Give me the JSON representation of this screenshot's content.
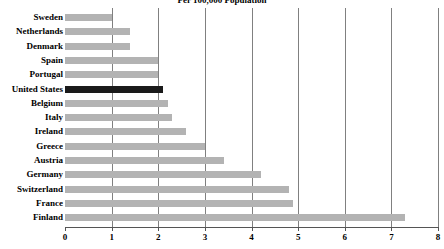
{
  "chart_data": {
    "type": "bar",
    "orientation": "horizontal",
    "title": "Per 100,000 Population",
    "xlabel": "",
    "ylabel": "",
    "xlim": [
      0,
      8
    ],
    "xticks": [
      0,
      1,
      2,
      3,
      4,
      5,
      6,
      7,
      8
    ],
    "xtick_labels": [
      "0",
      "1",
      "2",
      "3",
      "4",
      "5",
      "6",
      "7",
      "8"
    ],
    "grid": true,
    "gridlines_x": [
      1,
      2,
      3,
      4,
      5,
      6,
      7,
      8
    ],
    "legend": null,
    "categories": [
      "Sweden",
      "Netherlands",
      "Denmark",
      "Spain",
      "Portugal",
      "United States",
      "Belgium",
      "Italy",
      "Ireland",
      "Greece",
      "Austria",
      "Germany",
      "Switzerland",
      "France",
      "Finland"
    ],
    "values": [
      1.0,
      1.4,
      1.4,
      2.0,
      2.0,
      2.1,
      2.2,
      2.3,
      2.6,
      3.0,
      3.4,
      4.2,
      4.8,
      4.9,
      7.3
    ],
    "highlight_category": "United States",
    "colors": {
      "bar": "#b3b3b3",
      "highlight_bar": "#1a1a1a",
      "gridline": "#808080",
      "axis": "#555555",
      "text": "#000000",
      "background": "#ffffff"
    }
  }
}
